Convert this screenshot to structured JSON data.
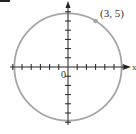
{
  "figure": {
    "corner_fragment": "",
    "origin_label": "0",
    "x_axis_label": "x",
    "point_label": "(3, 5)"
  },
  "colors": {
    "circle": "#a6a6a6",
    "axis": "#222222",
    "point": "#a6a6a6",
    "text": "#333333"
  },
  "chart_data": {
    "type": "scatter",
    "title": "",
    "xlabel": "x",
    "ylabel": "y",
    "circle": {
      "center": [
        0,
        0
      ],
      "radius": 5.831
    },
    "points": [
      {
        "x": 3,
        "y": 5,
        "label": "(3, 5)"
      }
    ],
    "origin_label": "0",
    "x_ticks": [
      -6,
      -5,
      -4,
      -3,
      -2,
      -1,
      1,
      2,
      3,
      4,
      5,
      6
    ],
    "y_ticks": [
      -6,
      -5,
      -4,
      -3,
      -2,
      -1,
      1,
      2,
      3,
      4,
      5,
      6
    ],
    "xlim": [
      -6.5,
      6.7
    ],
    "ylim": [
      -6.3,
      7.2
    ],
    "grid": false,
    "legend": null
  }
}
